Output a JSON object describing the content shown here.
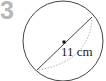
{
  "problem": {
    "number": "3"
  },
  "diagram": {
    "shape": "circle",
    "label": "11 cm",
    "measure": "diameter",
    "colors": {
      "stroke": "#444444",
      "dotted": "#aaaaaa",
      "number": "#b8b8b8"
    }
  }
}
